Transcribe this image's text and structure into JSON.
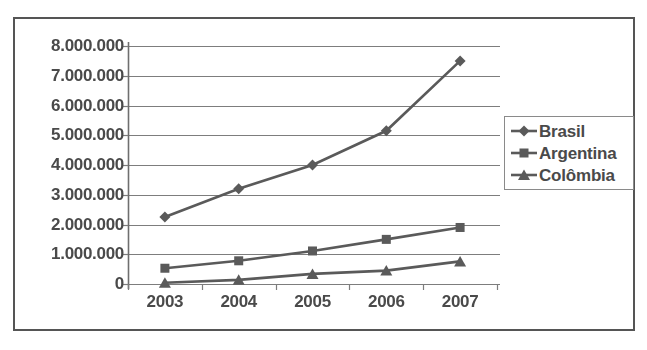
{
  "chart_data": {
    "type": "line",
    "title": "",
    "subtitle": "",
    "xlabel": "",
    "ylabel": "",
    "categories": [
      "2003",
      "2004",
      "2005",
      "2006",
      "2007"
    ],
    "x": [
      2003,
      2004,
      2005,
      2006,
      2007
    ],
    "ylim": [
      0,
      8000000
    ],
    "y_ticks": [
      0,
      1000000,
      2000000,
      3000000,
      4000000,
      5000000,
      6000000,
      7000000,
      8000000
    ],
    "y_tick_labels": [
      "0",
      "1.000.000",
      "2.000.000",
      "3.000.000",
      "4.000.000",
      "5.000.000",
      "6.000.000",
      "7.000.000",
      "8.000.000"
    ],
    "x_tick_labels": [
      "2003",
      "2004",
      "2005",
      "2006",
      "2007"
    ],
    "grid": {
      "horizontal": true,
      "vertical": false,
      "color": "#7d7d7d"
    },
    "legend": {
      "position": "right",
      "entries": [
        {
          "name": "Brasil",
          "marker": "diamond",
          "color": "#5a5a5a"
        },
        {
          "name": "Argentina",
          "marker": "square",
          "color": "#5a5a5a"
        },
        {
          "name": "Colômbia",
          "marker": "triangle",
          "color": "#5a5a5a"
        }
      ]
    },
    "series": [
      {
        "name": "Brasil",
        "marker": "diamond",
        "color": "#5a5a5a",
        "values": [
          2250000,
          3200000,
          4000000,
          5150000,
          7500000
        ]
      },
      {
        "name": "Argentina",
        "marker": "square",
        "color": "#5a5a5a",
        "values": [
          530000,
          780000,
          1110000,
          1500000,
          1900000
        ]
      },
      {
        "name": "Colômbia",
        "marker": "triangle",
        "color": "#5a5a5a",
        "values": [
          40000,
          140000,
          340000,
          450000,
          760000
        ]
      }
    ]
  },
  "legend": {
    "entries": [
      {
        "label": "Brasil"
      },
      {
        "label": "Argentina"
      },
      {
        "label": "Colômbia"
      }
    ]
  },
  "axes": {
    "y_labels": [
      "8.000.000",
      "7.000.000",
      "6.000.000",
      "5.000.000",
      "4.000.000",
      "3.000.000",
      "2.000.000",
      "1.000.000",
      "0"
    ],
    "x_labels": [
      "2003",
      "2004",
      "2005",
      "2006",
      "2007"
    ]
  },
  "colors": {
    "frame": "#555555",
    "grid": "#7d7d7d",
    "series": "#5a5a5a",
    "text": "#4a4a4a",
    "background": "#ffffff"
  }
}
